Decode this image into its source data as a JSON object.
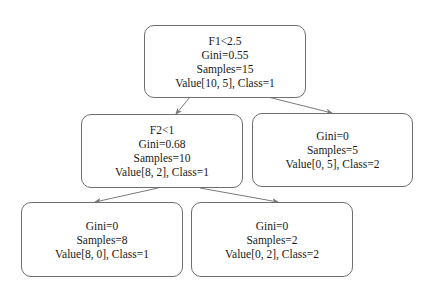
{
  "diagram": {
    "type": "decision-tree",
    "nodes": {
      "root": {
        "split": "F1<2.5",
        "gini": "Gini=0.55",
        "samples": "Samples=15",
        "value": "Value[10, 5], Class=1"
      },
      "left": {
        "split": "F2<1",
        "gini": "Gini=0.68",
        "samples": "Samples=10",
        "value": "Value[8, 2], Class=1"
      },
      "right": {
        "gini": "Gini=0",
        "samples": "Samples=5",
        "value": "Value[0, 5], Class=2"
      },
      "left_left": {
        "gini": "Gini=0",
        "samples": "Samples=8",
        "value": "Value[8, 0], Class=1"
      },
      "left_right": {
        "gini": "Gini=0",
        "samples": "Samples=2",
        "value": "Value[0, 2], Class=2"
      }
    },
    "edges": [
      {
        "from": "root",
        "to": "left"
      },
      {
        "from": "root",
        "to": "right"
      },
      {
        "from": "left",
        "to": "left_left"
      },
      {
        "from": "left",
        "to": "left_right"
      }
    ],
    "colors": {
      "border": "#6e6e6e",
      "edge": "#7a7a7a",
      "text": "#1a1a1a",
      "background": "#ffffff"
    }
  }
}
